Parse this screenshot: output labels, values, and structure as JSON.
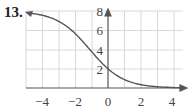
{
  "problem": {
    "number": "13."
  },
  "chart_data": {
    "type": "line",
    "title": "",
    "xlabel": "",
    "ylabel": "",
    "xlim": [
      -5,
      4.5
    ],
    "ylim": [
      0,
      8
    ],
    "grid": true,
    "x_ticks": [
      "-4",
      "-2",
      "0",
      "2",
      "4"
    ],
    "y_ticks": [
      "2",
      "4",
      "6",
      "8"
    ],
    "series": [
      {
        "name": "curve",
        "x": [
          -5,
          -4,
          -3,
          -2,
          -1,
          0,
          1,
          2,
          3,
          4
        ],
        "values": [
          7.84,
          7.59,
          6.96,
          5.69,
          3.8,
          2.0,
          0.88,
          0.35,
          0.13,
          0.05
        ]
      }
    ],
    "color": "#555555"
  }
}
